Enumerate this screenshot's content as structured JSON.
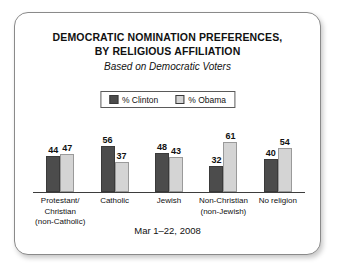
{
  "chart_data": {
    "type": "bar",
    "title": "DEMOCRATIC NOMINATION PREFERENCES, BY RELIGIOUS AFFILIATION",
    "title_line1": "DEMOCRATIC NOMINATION PREFERENCES,",
    "title_line2": "BY RELIGIOUS AFFILIATION",
    "subtitle": "Based on Democratic Voters",
    "footer": "Mar 1–22, 2008",
    "xlabel": "",
    "ylabel": "",
    "ylim": [
      0,
      70
    ],
    "grid": false,
    "legend_position": "top-center",
    "categories": [
      "Protestant/\nChristian\n(non-Catholic)",
      "Catholic",
      "Jewish",
      "Non-Christian\n(non-Jewish)",
      "No religion"
    ],
    "category_lines": [
      [
        "Protestant/",
        "Christian",
        "(non-Catholic)"
      ],
      [
        "Catholic"
      ],
      [
        "Jewish"
      ],
      [
        "Non-Christian",
        "(non-Jewish)"
      ],
      [
        "No religion"
      ]
    ],
    "series": [
      {
        "name": "% Clinton",
        "color": "#4c4c4c",
        "values": [
          44,
          56,
          48,
          32,
          40
        ]
      },
      {
        "name": "% Obama",
        "color": "#d4d4d4",
        "values": [
          47,
          37,
          43,
          61,
          54
        ]
      }
    ]
  },
  "legend": {
    "entries": [
      {
        "label": "% Clinton",
        "swatch": "clinton-swatch"
      },
      {
        "label": "% Obama",
        "swatch": "obama-swatch"
      }
    ]
  },
  "colors": {
    "clinton_bar": "#4c4c4c",
    "obama_bar": "#d4d4d4",
    "frame_border": "#8a8a8a",
    "axis_line": "#3d3d3d",
    "text": "#111111",
    "background": "#ffffff"
  }
}
